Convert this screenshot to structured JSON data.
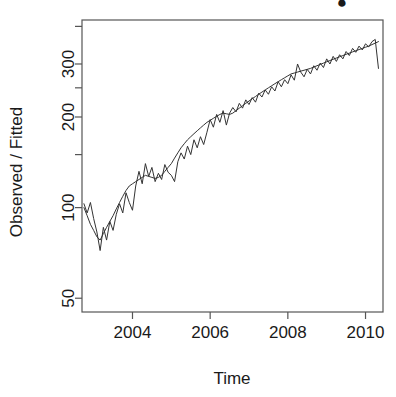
{
  "chart_data": {
    "type": "line",
    "title": "",
    "title_clipped_marker": "●",
    "xlabel": "Time",
    "ylabel": "Observed / Fitted",
    "y_scale": "log",
    "ylim": [
      45,
      420
    ],
    "xlim": [
      2002.7,
      2010.45
    ],
    "grid": false,
    "legend": null,
    "y_ticks": [
      50,
      100,
      150,
      200,
      250,
      300,
      400
    ],
    "y_tick_labels": [
      "50",
      "100",
      "",
      "200",
      "",
      "300",
      ""
    ],
    "x_ticks": [
      2004,
      2006,
      2008,
      2010
    ],
    "x_tick_labels": [
      "2004",
      "2006",
      "2008",
      "2010"
    ],
    "series": [
      {
        "name": "Observed",
        "x": [
          2002.75,
          2002.833,
          2002.917,
          2003.0,
          2003.083,
          2003.167,
          2003.25,
          2003.333,
          2003.417,
          2003.5,
          2003.583,
          2003.667,
          2003.75,
          2003.833,
          2003.917,
          2004.0,
          2004.083,
          2004.167,
          2004.25,
          2004.333,
          2004.417,
          2004.5,
          2004.583,
          2004.667,
          2004.75,
          2004.833,
          2004.917,
          2005.0,
          2005.083,
          2005.167,
          2005.25,
          2005.333,
          2005.417,
          2005.5,
          2005.583,
          2005.667,
          2005.75,
          2005.833,
          2005.917,
          2006.0,
          2006.083,
          2006.167,
          2006.25,
          2006.333,
          2006.417,
          2006.5,
          2006.583,
          2006.667,
          2006.75,
          2006.833,
          2006.917,
          2007.0,
          2007.083,
          2007.167,
          2007.25,
          2007.333,
          2007.417,
          2007.5,
          2007.583,
          2007.667,
          2007.75,
          2007.833,
          2007.917,
          2008.0,
          2008.083,
          2008.167,
          2008.25,
          2008.333,
          2008.417,
          2008.5,
          2008.583,
          2008.667,
          2008.75,
          2008.833,
          2008.917,
          2009.0,
          2009.083,
          2009.167,
          2009.25,
          2009.333,
          2009.417,
          2009.5,
          2009.583,
          2009.667,
          2009.75,
          2009.833,
          2009.917,
          2010.0,
          2010.083,
          2010.167,
          2010.25,
          2010.333
        ],
        "y": [
          103,
          96,
          104,
          92,
          83,
          72,
          86,
          78,
          90,
          84,
          95,
          103,
          96,
          112,
          104,
          98,
          118,
          132,
          120,
          140,
          127,
          136,
          122,
          130,
          124,
          139,
          131,
          128,
          122,
          142,
          152,
          145,
          160,
          150,
          168,
          158,
          172,
          162,
          178,
          196,
          185,
          204,
          192,
          210,
          188,
          206,
          215,
          208,
          222,
          214,
          228,
          220,
          232,
          224,
          240,
          233,
          246,
          238,
          252,
          244,
          262,
          252,
          266,
          258,
          276,
          265,
          300,
          282,
          272,
          288,
          278,
          296,
          286,
          302,
          292,
          312,
          300,
          318,
          306,
          322,
          312,
          330,
          320,
          338,
          328,
          344,
          334,
          350,
          342,
          356,
          362,
          290
        ]
      },
      {
        "name": "Fitted",
        "x": [
          2002.75,
          2002.833,
          2002.917,
          2003.0,
          2003.083,
          2003.167,
          2003.25,
          2003.333,
          2003.417,
          2003.5,
          2003.583,
          2003.667,
          2003.75,
          2003.833,
          2003.917,
          2004.0,
          2004.083,
          2004.167,
          2004.25,
          2004.333,
          2004.417,
          2004.5,
          2004.583,
          2004.667,
          2004.75,
          2004.833,
          2004.917,
          2005.0,
          2005.083,
          2005.167,
          2005.25,
          2005.333,
          2005.417,
          2005.5,
          2005.583,
          2005.667,
          2005.75,
          2005.833,
          2005.917,
          2006.0,
          2006.083,
          2006.167,
          2006.25,
          2006.333,
          2006.417,
          2006.5,
          2006.583,
          2006.667,
          2006.75,
          2006.833,
          2006.917,
          2007.0,
          2007.083,
          2007.167,
          2007.25,
          2007.333,
          2007.417,
          2007.5,
          2007.583,
          2007.667,
          2007.75,
          2007.833,
          2007.917,
          2008.0,
          2008.083,
          2008.167,
          2008.25,
          2008.333,
          2008.417,
          2008.5,
          2008.583,
          2008.667,
          2008.75,
          2008.833,
          2008.917,
          2009.0,
          2009.083,
          2009.167,
          2009.25,
          2009.333,
          2009.417,
          2009.5,
          2009.583,
          2009.667,
          2009.75,
          2009.833,
          2009.917,
          2010.0,
          2010.083,
          2010.167,
          2010.25,
          2010.333
        ],
        "y": [
          100,
          94,
          88,
          84,
          80,
          78,
          82,
          86,
          90,
          94,
          99,
          104,
          109,
          114,
          118,
          120,
          122,
          124,
          126,
          128,
          127,
          126,
          125,
          126,
          128,
          132,
          136,
          140,
          146,
          152,
          158,
          163,
          168,
          172,
          176,
          180,
          184,
          188,
          192,
          195,
          198,
          201,
          204,
          206,
          205,
          204,
          206,
          210,
          214,
          218,
          222,
          226,
          230,
          234,
          238,
          242,
          246,
          250,
          254,
          258,
          262,
          266,
          270,
          274,
          278,
          280,
          282,
          284,
          286,
          288,
          290,
          293,
          296,
          299,
          302,
          305,
          308,
          311,
          314,
          317,
          320,
          323,
          326,
          329,
          332,
          335,
          338,
          341,
          344,
          348,
          352,
          356
        ]
      }
    ]
  }
}
